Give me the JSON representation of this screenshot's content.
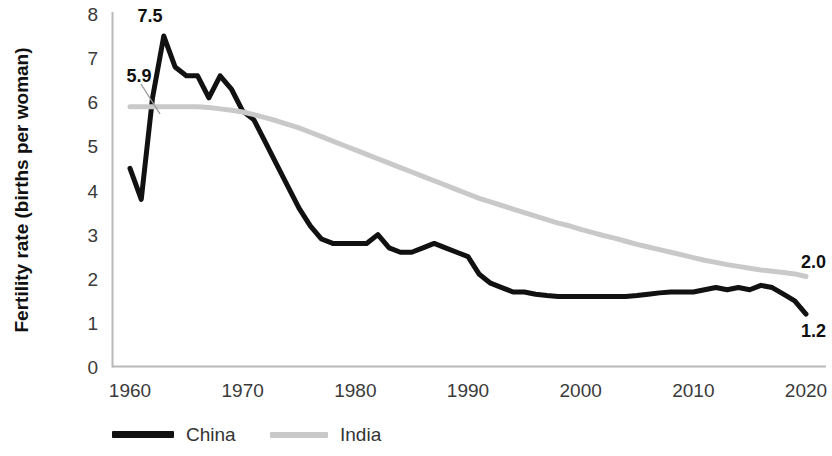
{
  "chart_data": {
    "type": "line",
    "title": "",
    "xlabel": "",
    "ylabel": "Fertility rate (births per woman)",
    "xlim": [
      1960,
      2021
    ],
    "ylim": [
      0,
      8
    ],
    "grid": false,
    "legend_position": "bottom-left",
    "x_ticks": [
      "1960",
      "1970",
      "1980",
      "1990",
      "2000",
      "2010",
      "2020"
    ],
    "x_tick_values": [
      1960,
      1970,
      1980,
      1990,
      2000,
      2010,
      2020
    ],
    "y_ticks": [
      "0",
      "1",
      "2",
      "3",
      "4",
      "5",
      "6",
      "7",
      "8"
    ],
    "y_tick_values": [
      0,
      1,
      2,
      3,
      4,
      5,
      6,
      7,
      8
    ],
    "x": [
      1960,
      1961,
      1962,
      1963,
      1964,
      1965,
      1966,
      1967,
      1968,
      1969,
      1970,
      1971,
      1972,
      1973,
      1974,
      1975,
      1976,
      1977,
      1978,
      1979,
      1980,
      1981,
      1982,
      1983,
      1984,
      1985,
      1986,
      1987,
      1988,
      1989,
      1990,
      1991,
      1992,
      1993,
      1994,
      1995,
      1996,
      1997,
      1998,
      1999,
      2000,
      2001,
      2002,
      2003,
      2004,
      2005,
      2006,
      2007,
      2008,
      2009,
      2010,
      2011,
      2012,
      2013,
      2014,
      2015,
      2016,
      2017,
      2018,
      2019,
      2020
    ],
    "series": [
      {
        "name": "China",
        "color": "#111111",
        "style": "solid",
        "width": 5,
        "values": [
          4.5,
          3.8,
          6.1,
          7.5,
          6.8,
          6.6,
          6.6,
          6.1,
          6.6,
          6.3,
          5.8,
          5.6,
          5.1,
          4.6,
          4.1,
          3.6,
          3.2,
          2.9,
          2.8,
          2.8,
          2.8,
          2.8,
          3.0,
          2.7,
          2.6,
          2.6,
          2.7,
          2.8,
          2.7,
          2.6,
          2.5,
          2.1,
          1.9,
          1.8,
          1.7,
          1.7,
          1.65,
          1.62,
          1.6,
          1.6,
          1.6,
          1.6,
          1.6,
          1.6,
          1.6,
          1.62,
          1.65,
          1.68,
          1.7,
          1.7,
          1.7,
          1.75,
          1.8,
          1.75,
          1.8,
          1.75,
          1.85,
          1.8,
          1.65,
          1.5,
          1.2
        ]
      },
      {
        "name": "India",
        "color": "#c9c9c9",
        "style": "solid",
        "width": 5,
        "values": [
          5.9,
          5.9,
          5.9,
          5.9,
          5.9,
          5.9,
          5.9,
          5.88,
          5.85,
          5.82,
          5.78,
          5.72,
          5.65,
          5.58,
          5.5,
          5.42,
          5.32,
          5.22,
          5.12,
          5.02,
          4.92,
          4.82,
          4.72,
          4.62,
          4.52,
          4.42,
          4.32,
          4.22,
          4.12,
          4.02,
          3.92,
          3.82,
          3.74,
          3.66,
          3.58,
          3.5,
          3.42,
          3.34,
          3.26,
          3.2,
          3.12,
          3.05,
          2.98,
          2.92,
          2.85,
          2.78,
          2.72,
          2.66,
          2.6,
          2.54,
          2.48,
          2.42,
          2.37,
          2.32,
          2.28,
          2.24,
          2.2,
          2.17,
          2.14,
          2.11,
          2.05
        ]
      }
    ],
    "annotations": [
      {
        "id": "china_peak",
        "text": "7.5",
        "value": 7.5,
        "year": 1963
      },
      {
        "id": "india_start",
        "text": "5.9",
        "value": 5.9,
        "year": 1960
      },
      {
        "id": "india_end",
        "text": "2.0",
        "value": 2.0,
        "year": 2020
      },
      {
        "id": "china_end",
        "text": "1.2",
        "value": 1.2,
        "year": 2020
      }
    ],
    "legend": [
      {
        "label": "China",
        "color": "#111111"
      },
      {
        "label": "India",
        "color": "#c9c9c9"
      }
    ]
  }
}
